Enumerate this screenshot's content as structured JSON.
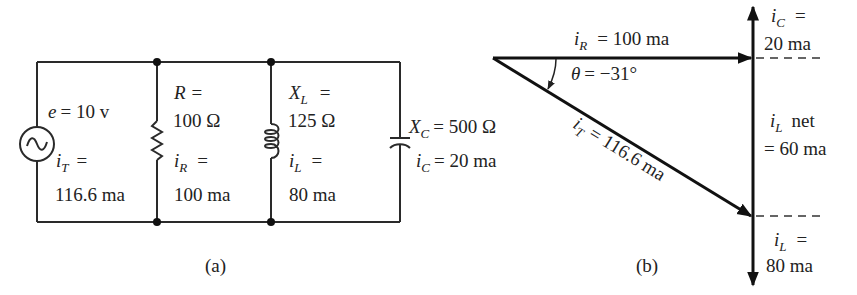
{
  "circuit": {
    "caption": "(a)",
    "source": {
      "voltage_label": "e = 10 v",
      "current_label_1": "=",
      "current_value": "116.6 ma",
      "current_symbol": "i",
      "current_sub": "T"
    },
    "resistor": {
      "symbol": "R",
      "eq": "=",
      "value": "100 Ω",
      "current_symbol": "i",
      "current_sub": "R",
      "current_eq": "=",
      "current_value": "100 ma"
    },
    "inductor": {
      "symbol": "X",
      "sub": "L",
      "eq": "=",
      "value": "125 Ω",
      "current_symbol": "i",
      "current_sub": "L",
      "current_eq": "=",
      "current_value": "80 ma"
    },
    "capacitor": {
      "symbol": "X",
      "sub": "C",
      "value": "= 500 Ω",
      "current_symbol": "i",
      "current_sub": "C",
      "current_value": "= 20 ma"
    }
  },
  "phasor": {
    "caption": "(b)",
    "iR": {
      "symbol": "i",
      "sub": "R",
      "value": "= 100 ma"
    },
    "theta": {
      "symbol": "θ",
      "value": "= −31°"
    },
    "iT": {
      "symbol": "i",
      "sub": "T",
      "value": "= 116.6 ma"
    },
    "iC": {
      "symbol": "i",
      "sub": "C",
      "eq": "=",
      "value": "20 ma"
    },
    "iLnet": {
      "symbol": "i",
      "sub": "L",
      "label": "net",
      "value": "= 60 ma"
    },
    "iL": {
      "symbol": "i",
      "sub": "L",
      "eq": "=",
      "value": "80 ma"
    }
  }
}
